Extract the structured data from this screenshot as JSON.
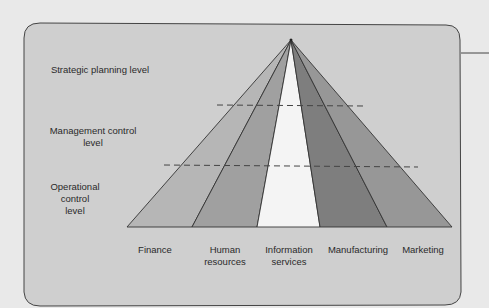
{
  "diagram": {
    "type": "pyramid",
    "apex": [
      291,
      40
    ],
    "base_y": 227,
    "base_x": [
      127,
      192,
      257,
      320,
      387,
      452
    ],
    "levels": [
      {
        "label": "Strategic planning level"
      },
      {
        "label_line1": "Management control",
        "label_line2": "level"
      },
      {
        "label_line1": "Operational",
        "label_line2": "control",
        "label_line3": "level"
      }
    ],
    "functions": [
      {
        "label_line1": "Finance",
        "label_line2": "",
        "fill": "#b5b5b5"
      },
      {
        "label_line1": "Human",
        "label_line2": "resources",
        "fill": "#9d9d9d"
      },
      {
        "label_line1": "Information",
        "label_line2": "services",
        "fill": "#f3f3f3"
      },
      {
        "label_line1": "Manufacturing",
        "label_line2": "",
        "fill": "#7f7f7f"
      },
      {
        "label_line1": "Marketing",
        "label_line2": "",
        "fill": "#959595"
      }
    ],
    "dividers": [
      {
        "y": 105,
        "x1": 217,
        "x2": 364
      },
      {
        "y": 166,
        "x1": 164,
        "x2": 418
      }
    ],
    "colors": {
      "page_bg": "#e9e9e9",
      "panel_bg": "#cfcfcf",
      "outline": "#333333"
    }
  }
}
